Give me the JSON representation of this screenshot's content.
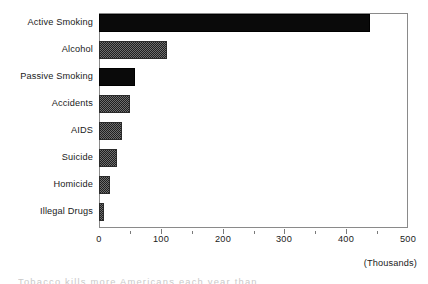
{
  "chart_data": {
    "type": "bar",
    "orientation": "horizontal",
    "title": "",
    "subtitle": "",
    "xlabel": "(Thousands)",
    "ylabel": "",
    "categories": [
      "Active Smoking",
      "Alcohol",
      "Passive Smoking",
      "Accidents",
      "AIDS",
      "Suicide",
      "Homicide",
      "Illegal Drugs"
    ],
    "values": [
      438,
      110,
      58,
      50,
      37,
      29,
      18,
      8
    ],
    "bar_fills": [
      "solid",
      "dither",
      "solid",
      "dither",
      "dither",
      "dither",
      "dither",
      "dither"
    ],
    "xlim": [
      0,
      500
    ],
    "x_ticks": [
      0,
      100,
      200,
      300,
      400,
      500
    ],
    "x_tick_labels": [
      "0",
      "100",
      "200",
      "300",
      "400",
      "500"
    ],
    "x_minor_ticks": [
      50,
      150,
      250,
      350,
      450
    ],
    "grid": false,
    "legend": null,
    "frame": true,
    "units_note": "(Thousands)",
    "colors": {
      "background": "#ffffff",
      "bar_solid": "#0a0a0a",
      "bar_dither": "#6e6e6e",
      "axis": "#8a8a8a",
      "text": "#1a1a1a"
    }
  },
  "caption_fragment": "Tobacco kills more Americans each year than"
}
